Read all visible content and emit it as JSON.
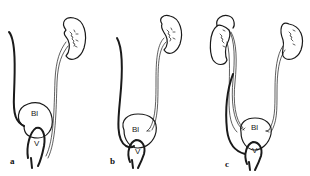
{
  "figure": {
    "panels": [
      {
        "id": "a",
        "label": "a",
        "bladder_label": "Bl",
        "vagina_label": "V",
        "description": "Single kidney with ureter draining beside bladder into vagina; contralateral ureter remnant"
      },
      {
        "id": "b",
        "label": "b",
        "bladder_label": "Bl",
        "vagina_label": "V",
        "description": "Single kidney with ureter entering bladder; contralateral duct ending at vagina"
      },
      {
        "id": "c",
        "label": "c",
        "bladder_label": "Bl",
        "vagina_label": "V",
        "description": "Bilateral kidneys (left duplex) with ureters entering bladder; ectopic ureter to vagina"
      }
    ]
  }
}
